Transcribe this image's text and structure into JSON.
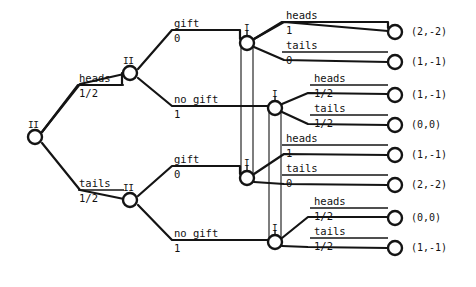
{
  "figure": {
    "kind": "extensive-form-game-tree",
    "title": "",
    "stroke_color": "#141414",
    "node_fill": "#ffffff"
  },
  "players": {
    "one": "I",
    "two": "II"
  },
  "nodes": {
    "root": {
      "id": "root",
      "player": "II",
      "x": 35,
      "y": 137,
      "label": "II"
    },
    "heads": {
      "id": "heads",
      "player": "II",
      "x": 130,
      "y": 73,
      "label": "II"
    },
    "tails": {
      "id": "tails",
      "player": "II",
      "x": 130,
      "y": 200,
      "label": "II"
    },
    "gift_top": {
      "id": "gift_top",
      "player": "I",
      "x": 247,
      "y": 43,
      "label": "I"
    },
    "nogift_top": {
      "id": "nogift_top",
      "player": "I",
      "x": 275,
      "y": 108,
      "label": "I"
    },
    "gift_bot": {
      "id": "gift_bot",
      "player": "I",
      "x": 247,
      "y": 178,
      "label": "I"
    },
    "nogift_bot": {
      "id": "nogift_bot",
      "player": "I",
      "x": 275,
      "y": 242,
      "label": "I"
    }
  },
  "edges": {
    "chance": [
      {
        "name": "heads",
        "action": "heads",
        "prob": "1/2"
      },
      {
        "name": "tails",
        "action": "tails",
        "prob": "1/2"
      }
    ],
    "player_two": [
      {
        "name": "gift-top",
        "action": "gift",
        "prob": "0"
      },
      {
        "name": "no-gift-top",
        "action": "no gift",
        "prob": "1"
      },
      {
        "name": "gift-bottom",
        "action": "gift",
        "prob": "0"
      },
      {
        "name": "no-gift-bottom",
        "action": "no gift",
        "prob": "1"
      }
    ],
    "player_one": [
      {
        "name": "heads-1",
        "action": "heads",
        "prob": "1"
      },
      {
        "name": "tails-1",
        "action": "tails",
        "prob": "0"
      },
      {
        "name": "heads-2",
        "action": "heads",
        "prob": "1/2"
      },
      {
        "name": "tails-2",
        "action": "tails",
        "prob": "1/2"
      },
      {
        "name": "heads-3",
        "action": "heads",
        "prob": "1"
      },
      {
        "name": "tails-3",
        "action": "tails",
        "prob": "0"
      },
      {
        "name": "heads-4",
        "action": "heads",
        "prob": "1/2"
      },
      {
        "name": "tails-4",
        "action": "tails",
        "prob": "1/2"
      }
    ]
  },
  "terminals": [
    {
      "name": "terminal-1",
      "x": 395,
      "y": 32,
      "payoff": "(2,-2)"
    },
    {
      "name": "terminal-2",
      "x": 395,
      "y": 62,
      "payoff": "(1,-1)"
    },
    {
      "name": "terminal-3",
      "x": 395,
      "y": 95,
      "payoff": "(1,-1)"
    },
    {
      "name": "terminal-4",
      "x": 395,
      "y": 125,
      "payoff": "(0,0)"
    },
    {
      "name": "terminal-5",
      "x": 395,
      "y": 155,
      "payoff": "(1,-1)"
    },
    {
      "name": "terminal-6",
      "x": 395,
      "y": 185,
      "payoff": "(2,-2)"
    },
    {
      "name": "terminal-7",
      "x": 395,
      "y": 218,
      "payoff": "(0,0)"
    },
    {
      "name": "terminal-8",
      "x": 395,
      "y": 248,
      "payoff": "(1,-1)"
    }
  ],
  "info_sets": [
    {
      "name": "info-set-gift",
      "from": "gift_top",
      "to": "gift_bot"
    },
    {
      "name": "info-set-no-gift",
      "from": "nogift_top",
      "to": "nogift_bot"
    }
  ],
  "labels": {
    "heads_action": "heads",
    "heads_prob": "1/2",
    "tails_action": "tails",
    "tails_prob": "1/2",
    "gift_action": "gift",
    "gift_prob": "0",
    "nogift_action": "no gift",
    "nogift_prob": "1",
    "p1_heads": "heads",
    "p1_tails": "tails",
    "one": "1",
    "zero": "0",
    "half": "1/2"
  }
}
